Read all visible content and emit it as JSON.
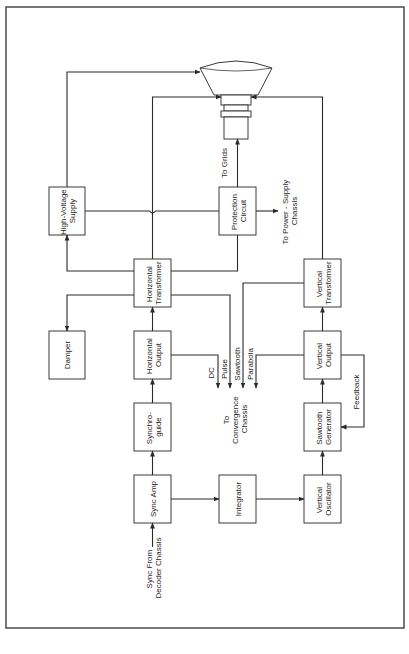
{
  "diagram": {
    "type": "block-diagram",
    "orientation": "rotated-90-ccw",
    "colors": {
      "line": "#2a2a2a",
      "box_border": "#3a3a3a",
      "background": "#ffffff",
      "frame": "#555555"
    },
    "blocks": {
      "hv_supply": [
        "High-Voltage",
        "Supply"
      ],
      "protection": [
        "Protection",
        "Circuit"
      ],
      "h_transformer": [
        "Horizontal",
        "Transformer"
      ],
      "v_transformer": [
        "Vertical",
        "Transformer"
      ],
      "damper": [
        "Damper"
      ],
      "h_output": [
        "Horizontal",
        "Output"
      ],
      "v_output": [
        "Vertical",
        "Output"
      ],
      "synchroguide": [
        "Synchro-",
        "guide"
      ],
      "sawtooth": [
        "Sawtooth",
        "Generator"
      ],
      "sync_amp": [
        "Sync Amp"
      ],
      "integrator": [
        "Integrator"
      ],
      "v_oscillator": [
        "Vertical",
        "Oscillator"
      ]
    },
    "labels": {
      "to_grids": "To Grids",
      "to_power": [
        "To Power - Supply",
        "Chassis"
      ],
      "dc": "DC",
      "pulse": "Pulse",
      "sawtooth": "Sawtooth",
      "parabola": "Parabola",
      "to_convergence": [
        "To",
        "Convergence",
        "Chassis"
      ],
      "feedback": "Feedback",
      "sync_from": [
        "Sync From",
        "Decoder Chassis"
      ]
    },
    "picture_tube": "CRT (picture tube)",
    "connections": [
      [
        "Sync From Decoder Chassis",
        "Sync Amp"
      ],
      [
        "Sync Amp",
        "Synchroguide"
      ],
      [
        "Sync Amp",
        "Integrator"
      ],
      [
        "Integrator",
        "Vertical Oscillator"
      ],
      [
        "Vertical Oscillator",
        "Sawtooth Generator"
      ],
      [
        "Sawtooth Generator",
        "Vertical Output"
      ],
      [
        "Vertical Output",
        "Sawtooth Generator (Feedback)"
      ],
      [
        "Vertical Output",
        "Vertical Transformer"
      ],
      [
        "Vertical Output",
        "Convergence Chassis (Parabola)"
      ],
      [
        "Vertical Transformer",
        "Convergence Chassis (Sawtooth)"
      ],
      [
        "Vertical Transformer",
        "Picture Tube"
      ],
      [
        "Synchroguide",
        "Horizontal Output"
      ],
      [
        "Horizontal Output",
        "Horizontal Transformer"
      ],
      [
        "Horizontal Output",
        "Convergence Chassis (DC)"
      ],
      [
        "Horizontal Transformer",
        "Convergence Chassis (Pulse)"
      ],
      [
        "Horizontal Transformer",
        "Damper"
      ],
      [
        "Horizontal Transformer",
        "High-Voltage Supply"
      ],
      [
        "Horizontal Transformer",
        "Picture Tube"
      ],
      [
        "Horizontal Transformer",
        "Protection Circuit"
      ],
      [
        "High-Voltage Supply",
        "Picture Tube"
      ],
      [
        "High-Voltage Supply",
        "Protection Circuit"
      ],
      [
        "Protection Circuit",
        "Picture Tube (To Grids)"
      ],
      [
        "Protection Circuit",
        "Power-Supply Chassis"
      ]
    ]
  }
}
